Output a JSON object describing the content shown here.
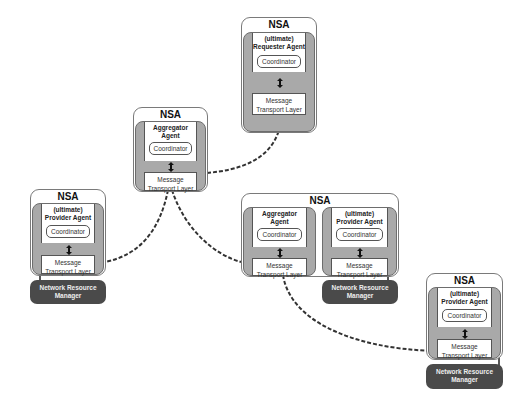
{
  "diagram": {
    "colors": {
      "agent_fill": "#a9a9a9",
      "nrm_fill": "#4a4a4a",
      "link": "#333333",
      "border": "#7a7a7a"
    },
    "nsa_label": "NSA",
    "coordinator_label": "Coordinator",
    "mtl_line1": "Message",
    "mtl_line2": "Transport Layer",
    "nrm_line1": "Network Resource",
    "nrm_line2": "Manager",
    "nodes": {
      "requester": {
        "role_line1": "(ultimate)",
        "role_line2": "Requester Agent"
      },
      "aggregator_top": {
        "role_line1": "Aggregator",
        "role_line2": "Agent"
      },
      "provider_left": {
        "role_line1": "(ultimate)",
        "role_line2": "Provider Agent"
      },
      "aggregator_mid": {
        "role_line1": "Aggregator",
        "role_line2": "Agent"
      },
      "provider_mid": {
        "role_line1": "(ultimate)",
        "role_line2": "Provider Agent"
      },
      "provider_right": {
        "role_line1": "(ultimate)",
        "role_line2": "Provider Agent"
      }
    }
  }
}
